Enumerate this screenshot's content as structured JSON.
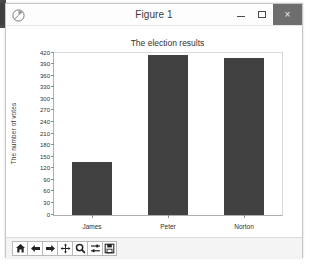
{
  "window": {
    "title": "Figure 1",
    "app_icon": "matplotlib-icon",
    "buttons": {
      "minimize": "–",
      "maximize": "□",
      "close": "×"
    }
  },
  "toolbar": {
    "items": [
      {
        "name": "home-icon",
        "tooltip": "Home"
      },
      {
        "name": "back-arrow-icon",
        "tooltip": "Back"
      },
      {
        "name": "forward-arrow-icon",
        "tooltip": "Forward"
      },
      {
        "name": "pan-move-icon",
        "tooltip": "Pan"
      },
      {
        "name": "zoom-magnifier-icon",
        "tooltip": "Zoom to rectangle"
      },
      {
        "name": "configure-subplots-icon",
        "tooltip": "Configure subplots"
      },
      {
        "name": "save-disk-icon",
        "tooltip": "Save the figure"
      }
    ]
  },
  "chart_data": {
    "type": "bar",
    "title": "The election results",
    "xlabel": "",
    "ylabel": "The number of votes",
    "categories": [
      "James",
      "Peter",
      "Norton"
    ],
    "values": [
      137,
      415,
      408
    ],
    "ylim": [
      0,
      420
    ],
    "yticks": [
      0,
      30,
      60,
      90,
      120,
      150,
      180,
      210,
      240,
      270,
      300,
      330,
      360,
      390,
      420
    ],
    "bar_color": "#414141",
    "grid": false,
    "legend": null
  }
}
